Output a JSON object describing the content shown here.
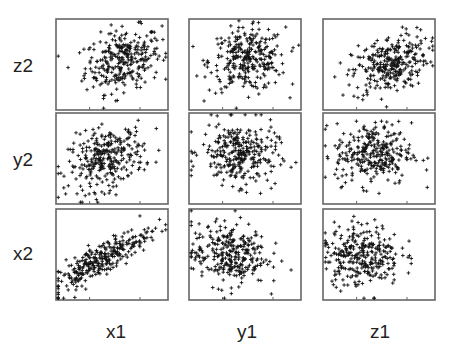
{
  "chart_data": {
    "type": "scatter",
    "title": "",
    "layout": "scatterplot-matrix",
    "rows": [
      "z2",
      "y2",
      "x2"
    ],
    "columns": [
      "x1",
      "y1",
      "z1"
    ],
    "n_points_per_panel": 300,
    "marker": "+",
    "marker_color": "#111111",
    "frame_color": "#666666",
    "panels": [
      {
        "row": "z2",
        "col": "x1",
        "correlation": 0.25,
        "x_center": 0.6,
        "y_center": 0.55
      },
      {
        "row": "z2",
        "col": "y1",
        "correlation": 0.05,
        "x_center": 0.52,
        "y_center": 0.55
      },
      {
        "row": "z2",
        "col": "z1",
        "correlation": 0.35,
        "x_center": 0.6,
        "y_center": 0.5
      },
      {
        "row": "y2",
        "col": "x1",
        "correlation": 0.3,
        "x_center": 0.45,
        "y_center": 0.5
      },
      {
        "row": "y2",
        "col": "y1",
        "correlation": -0.05,
        "x_center": 0.45,
        "y_center": 0.55
      },
      {
        "row": "y2",
        "col": "z1",
        "correlation": 0.0,
        "x_center": 0.45,
        "y_center": 0.55
      },
      {
        "row": "x2",
        "col": "x1",
        "correlation": 0.85,
        "x_center": 0.4,
        "y_center": 0.45
      },
      {
        "row": "x2",
        "col": "y1",
        "correlation": 0.0,
        "x_center": 0.35,
        "y_center": 0.5
      },
      {
        "row": "x2",
        "col": "z1",
        "correlation": 0.0,
        "x_center": 0.35,
        "y_center": 0.5
      }
    ],
    "grid": false,
    "legend": "none"
  }
}
